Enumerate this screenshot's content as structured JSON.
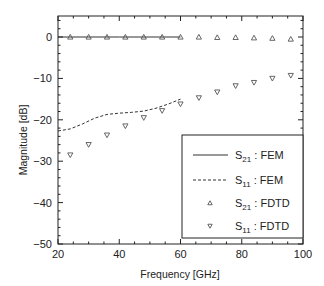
{
  "chart_data": {
    "type": "line",
    "title": "",
    "xlabel": "Frequency [GHz]",
    "ylabel": "Magnitude [dB]",
    "xlim": [
      20,
      100
    ],
    "ylim": [
      -50,
      5
    ],
    "xticks": [
      20,
      40,
      60,
      80,
      100
    ],
    "yticks": [
      0,
      -10,
      -20,
      -30,
      -40,
      -50
    ],
    "xtick_labels": [
      "20",
      "40",
      "60",
      "80",
      "100"
    ],
    "ytick_labels": [
      "0",
      "−10",
      "−20",
      "−30",
      "−40",
      "−50"
    ],
    "grid": false,
    "legend_position": "lower right",
    "series": [
      {
        "name": "S21 : FEM",
        "label_main": "S",
        "label_sub": "21",
        "label_rest": " : FEM",
        "style": "solid-line",
        "x": [
          20,
          30,
          40,
          50,
          60
        ],
        "values": [
          0,
          0,
          0,
          0,
          0
        ]
      },
      {
        "name": "S11 : FEM",
        "label_main": "S",
        "label_sub": "11",
        "label_rest": " : FEM",
        "style": "dashed-line",
        "x": [
          20,
          24,
          28,
          32,
          36,
          40,
          44,
          48,
          52,
          56,
          60
        ],
        "values": [
          -22.7,
          -22.2,
          -21.0,
          -19.6,
          -18.7,
          -18.4,
          -18.2,
          -17.9,
          -17.2,
          -16.2,
          -15.0
        ]
      },
      {
        "name": "S21 : FDTD",
        "label_main": "S",
        "label_sub": "21",
        "label_rest": " : FDTD",
        "style": "triangle-up",
        "x": [
          24,
          30,
          36,
          42,
          48,
          54,
          60,
          66,
          72,
          78,
          84,
          90,
          96
        ],
        "values": [
          0,
          0,
          0,
          0,
          0,
          0,
          0,
          0,
          -0.1,
          -0.1,
          -0.2,
          -0.3,
          -0.5
        ]
      },
      {
        "name": "S11 : FDTD",
        "label_main": "S",
        "label_sub": "11",
        "label_rest": " : FDTD",
        "style": "triangle-down",
        "x": [
          24,
          30,
          36,
          42,
          48,
          54,
          60,
          66,
          72,
          78,
          84,
          90,
          96
        ],
        "values": [
          -28.5,
          -26.0,
          -23.7,
          -21.5,
          -19.5,
          -17.8,
          -16.2,
          -14.7,
          -13.3,
          -11.8,
          -11.0,
          -10.0,
          -9.3
        ]
      }
    ]
  },
  "colors": {
    "line": "#333333",
    "marker": "#555555",
    "axis": "#222222"
  }
}
